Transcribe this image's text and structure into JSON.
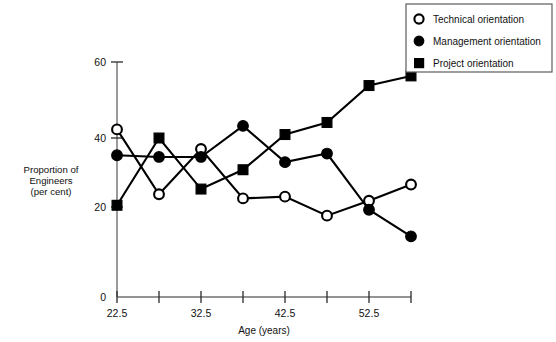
{
  "chart_data": {
    "type": "line",
    "title": "",
    "xlabel": "Age (years)",
    "ylabel": "Proportion of Engineers (per cent)",
    "ylabel_lines": [
      "Proportion of",
      "Engineers",
      "(per cent)"
    ],
    "x": [
      22.5,
      27.5,
      32.5,
      37.5,
      42.5,
      47.5,
      52.5,
      57.5
    ],
    "xtick_labels": [
      "22.5",
      "",
      "32.5",
      "",
      "42.5",
      "",
      "52.5",
      ""
    ],
    "xtick_labels_all": [
      "22.5",
      "27.5",
      "32.5",
      "37.5",
      "42.5",
      "47.5",
      "52.5",
      "57.5"
    ],
    "xlim": [
      22.5,
      57.5
    ],
    "ylim": [
      0,
      60
    ],
    "yticks": [
      20,
      40,
      60
    ],
    "ytick_labels": [
      "20",
      "40",
      "60"
    ],
    "origin_label": "0",
    "grid": false,
    "legend_position": "top-right",
    "series": [
      {
        "name": "Technical orientation",
        "marker": "open-circle",
        "values": [
          42.5,
          23.7,
          36.8,
          22.5,
          23.0,
          17.5,
          21.8,
          26.5
        ]
      },
      {
        "name": "Management orientation",
        "marker": "filled-circle",
        "values": [
          35.0,
          34.5,
          34.5,
          43.5,
          33.0,
          35.5,
          19.2,
          11.5
        ]
      },
      {
        "name": "Project orientation",
        "marker": "filled-square",
        "values": [
          20.5,
          40.0,
          25.2,
          30.8,
          41.0,
          44.5,
          55.2,
          58.0
        ]
      }
    ]
  },
  "legend": {
    "items": [
      {
        "label": "Technical orientation",
        "marker": "open-circle"
      },
      {
        "label": "Management orientation",
        "marker": "filled-circle"
      },
      {
        "label": "Project orientation",
        "marker": "filled-square"
      }
    ]
  },
  "axes": {
    "x_title": "Age (years)",
    "y_title_lines": [
      "Proportion of",
      "Engineers",
      "(per cent)"
    ],
    "y_tick_60": "60",
    "y_tick_40": "40",
    "y_tick_20": "20",
    "y_tick_0": "0",
    "x_tick_1": "22.5",
    "x_tick_3": "32.5",
    "x_tick_5": "42.5",
    "x_tick_7": "52.5"
  }
}
